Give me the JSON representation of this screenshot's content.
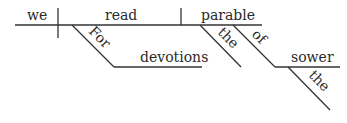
{
  "diagram": {
    "type": "sentence-diagram",
    "sentence": "For devotions we read the parable of the sower",
    "words": {
      "subject": "we",
      "verb": "read",
      "object": "parable",
      "preposition_1": "For",
      "prep_object_1": "devotions",
      "object_modifier": "the",
      "preposition_2": "of",
      "prep_object_2": "sower",
      "prep_object_2_modifier": "the"
    },
    "colors": {
      "line": "#333333",
      "text": "#2a2a2a"
    }
  }
}
